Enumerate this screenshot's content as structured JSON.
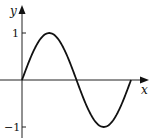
{
  "chart_data": {
    "type": "line",
    "title": "",
    "xlabel": "x",
    "ylabel": "y",
    "yticks": [
      "1",
      "−1"
    ],
    "ytick_values": [
      1,
      -1
    ],
    "series": [
      {
        "name": "y = sin x",
        "x": [
          0,
          0.785,
          1.571,
          2.356,
          3.142,
          3.927,
          4.712,
          5.498,
          6.283
        ],
        "y": [
          0,
          0.707,
          1,
          0.707,
          0,
          -0.707,
          -1,
          -0.707,
          0
        ]
      }
    ],
    "xlim": [
      0,
      6.283
    ],
    "ylim": [
      -1,
      1
    ],
    "grid": false,
    "legend": "none"
  },
  "labels": {
    "x_axis": "x",
    "y_axis": "y",
    "tick_pos": "1",
    "tick_neg": "−1"
  }
}
